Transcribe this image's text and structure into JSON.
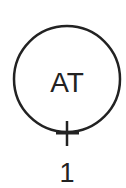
{
  "instrument": {
    "function_letters": "AT",
    "tag_number": "1",
    "symbol_type": "field-mounted instrument bubble",
    "colors": {
      "stroke": "#222222",
      "background": "#ffffff"
    }
  }
}
